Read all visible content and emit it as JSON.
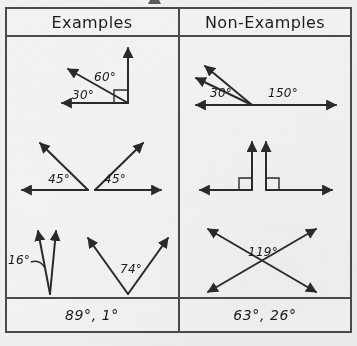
{
  "sheet": {
    "background_color": "#f2f2f0",
    "ink_color": "#2a2a2a"
  },
  "table": {
    "columns": [
      {
        "header": "Examples"
      },
      {
        "header": "Non-Examples"
      }
    ],
    "footer": {
      "examples": "89°, 1°",
      "non_examples": "63°, 26°"
    }
  },
  "figures": {
    "ex_row1": {
      "labels": {
        "a": "60°",
        "b": "30°"
      },
      "right_angle_marker": true
    },
    "ex_row2": {
      "labels": {
        "left": "45°",
        "right": "45°"
      }
    },
    "ex_row3": {
      "labels": {
        "left": "16°",
        "right": "74°"
      }
    },
    "nonex_row1": {
      "labels": {
        "left": "30°",
        "right": "150°"
      }
    },
    "nonex_row2": {
      "labels": {},
      "right_angle_markers": 2
    },
    "nonex_row3": {
      "labels": {
        "center": "119°"
      }
    }
  },
  "topmark": {
    "glyph": "partial-descender"
  }
}
